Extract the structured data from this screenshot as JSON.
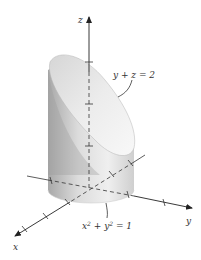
{
  "figure": {
    "axes": {
      "x_label": "x",
      "y_label": "y",
      "z_label": "z"
    },
    "annotations": {
      "plane_equation": "y + z = 2",
      "cylinder_equation_base": "x",
      "cylinder_equation_sup1": "2",
      "cylinder_equation_mid": " + y",
      "cylinder_equation_sup2": "2",
      "cylinder_equation_tail": " = 1"
    },
    "colors": {
      "axis": "#333333",
      "surface_light": "#f2f2f2",
      "surface_mid": "#d9d9d9",
      "surface_dark": "#a8a8a8",
      "background": "#ffffff"
    }
  }
}
